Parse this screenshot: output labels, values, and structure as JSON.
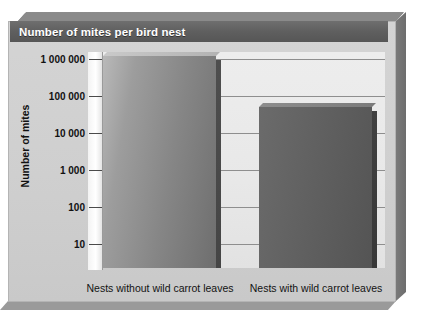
{
  "title": "Number of mites per bird nest",
  "axes": {
    "y_title": "Number of mites",
    "y_ticks": [
      "1 000 000",
      "100 000",
      "10 000",
      "1 000",
      "100",
      "10"
    ]
  },
  "categories": [
    "Nests without wild carrot leaves",
    "Nests with wild carrot leaves"
  ],
  "colors": {
    "banner": "#5f5f5f",
    "panel": "#cfcfcf",
    "plot": "#e9e9e9",
    "grid": "#8e8e8e",
    "bar_light": "#8b8b8b",
    "bar_dark": "#5d5d5d"
  },
  "chart_data": {
    "type": "bar",
    "title": "Number of mites per bird nest",
    "xlabel": "",
    "ylabel": "Number of mites",
    "yscale": "log",
    "ylim": [
      5,
      2000000
    ],
    "grid": true,
    "legend": "none",
    "categories": [
      "Nests without wild carrot leaves",
      "Nests with wild carrot leaves"
    ],
    "tick_values": [
      1000000,
      100000,
      10000,
      1000,
      100,
      10
    ],
    "tick_labels": [
      "1 000 000",
      "100 000",
      "10 000",
      "1 000",
      "100",
      "10"
    ],
    "values": [
      1200000,
      50000
    ],
    "value_labels": [
      "about 1 000 000",
      "about 50 000"
    ]
  }
}
